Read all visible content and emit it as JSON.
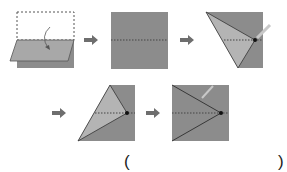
{
  "diagram": {
    "steps": [
      {
        "id": 1,
        "desc": "Fold top half down along middle"
      },
      {
        "id": 2,
        "desc": "Square with horizontal dotted center crease"
      },
      {
        "id": 3,
        "desc": "Top-left corner folded to center point"
      },
      {
        "id": 4,
        "desc": "Bottom-left corner folded to center point"
      },
      {
        "id": 5,
        "desc": "Result: triangle with apex at right center point"
      }
    ],
    "colors": {
      "paper_dark": "#8c8c8c",
      "paper_light": "#b4b4b4",
      "arrow": "#6e6e6e",
      "dot": "#111111"
    }
  },
  "answer": {
    "open_paren": "(",
    "close_paren": ")"
  }
}
